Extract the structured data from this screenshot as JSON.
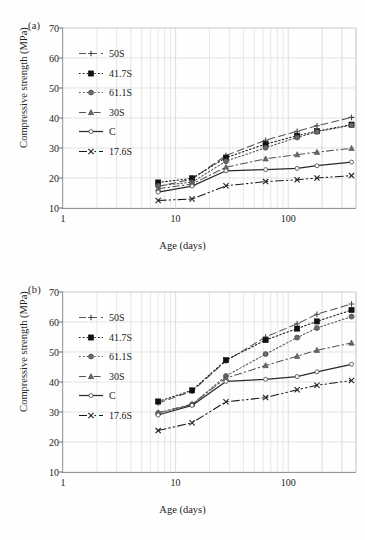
{
  "figure": {
    "panels": [
      {
        "tag": "(a)",
        "id": "a"
      },
      {
        "tag": "(b)",
        "id": "b"
      }
    ],
    "axis": {
      "ylabel": "Compressive strength (MPa)",
      "xlabel": "Age (days)",
      "yticks": [
        10,
        20,
        30,
        40,
        50,
        60,
        70
      ],
      "xticks": [
        1,
        10,
        100
      ],
      "xtick_labels": [
        "1",
        "10",
        "100"
      ],
      "ylim": [
        10,
        70
      ],
      "xlim": [
        1,
        400
      ],
      "grid": true
    },
    "colors": {
      "axis": "#6f6f6f",
      "grid": "#d8d8d8",
      "ink": "#1a1a1a",
      "gray_series": "#6a6a6a",
      "background": "#fefefe"
    }
  },
  "chart_data": [
    {
      "type": "line",
      "title": "(a)",
      "xlabel": "Age (days)",
      "ylabel": "Compressive strength (MPa)",
      "xscale": "log",
      "xlim": [
        1,
        400
      ],
      "ylim": [
        10,
        70
      ],
      "grid": true,
      "legend_position": "upper-left-inside",
      "x": [
        7,
        14,
        28,
        63,
        120,
        180,
        365
      ],
      "series": [
        {
          "name": "50S",
          "marker": "cross",
          "dash": "dashed",
          "values": [
            17.2,
            19.6,
            27.5,
            32.6,
            35.6,
            37.4,
            40.2
          ]
        },
        {
          "name": "41.7S",
          "marker": "filled-square",
          "dash": "dotted",
          "values": [
            18.5,
            19.9,
            26.8,
            31.3,
            34.1,
            35.6,
            37.8
          ]
        },
        {
          "name": "61.1S",
          "marker": "circle-gray",
          "dash": "dotted",
          "values": [
            17.4,
            18.6,
            25.6,
            30.1,
            33.5,
            35.4,
            37.6
          ]
        },
        {
          "name": "30S",
          "marker": "triangle",
          "dash": "dash-dot",
          "values": [
            16.4,
            18.0,
            23.6,
            26.4,
            27.8,
            28.6,
            29.9
          ]
        },
        {
          "name": "C",
          "marker": "small-circle",
          "dash": "solid",
          "values": [
            15.3,
            17.3,
            22.4,
            22.8,
            23.2,
            24.1,
            25.3
          ]
        },
        {
          "name": "17.6S",
          "marker": "x",
          "dash": "dash-dot-dot",
          "values": [
            12.5,
            13.0,
            17.4,
            18.8,
            19.4,
            20.0,
            20.8
          ]
        }
      ]
    },
    {
      "type": "line",
      "title": "(b)",
      "xlabel": "Age (days)",
      "ylabel": "Compressive strength (MPa)",
      "xscale": "log",
      "xlim": [
        1,
        400
      ],
      "ylim": [
        10,
        70
      ],
      "grid": true,
      "legend_position": "upper-left-inside",
      "x": [
        7,
        14,
        28,
        63,
        120,
        180,
        365
      ],
      "series": [
        {
          "name": "50S",
          "marker": "cross",
          "dash": "dashed",
          "values": [
            33.0,
            36.9,
            47.0,
            55.0,
            59.4,
            62.6,
            66.0
          ]
        },
        {
          "name": "41.7S",
          "marker": "filled-square",
          "dash": "dotted",
          "values": [
            33.5,
            37.2,
            47.3,
            54.0,
            57.8,
            60.2,
            64.0
          ]
        },
        {
          "name": "61.1S",
          "marker": "circle-gray",
          "dash": "dotted",
          "values": [
            29.6,
            32.5,
            42.0,
            49.3,
            54.8,
            58.0,
            61.8
          ]
        },
        {
          "name": "30S",
          "marker": "triangle",
          "dash": "dash-dot",
          "values": [
            29.8,
            32.6,
            41.3,
            45.5,
            48.6,
            50.6,
            53.0
          ]
        },
        {
          "name": "C",
          "marker": "small-circle",
          "dash": "solid",
          "values": [
            29.0,
            32.2,
            40.2,
            40.9,
            41.8,
            43.4,
            45.9
          ]
        },
        {
          "name": "17.6S",
          "marker": "x",
          "dash": "dash-dot-dot",
          "values": [
            23.8,
            26.4,
            33.4,
            34.8,
            37.4,
            38.9,
            40.5
          ]
        }
      ]
    }
  ]
}
